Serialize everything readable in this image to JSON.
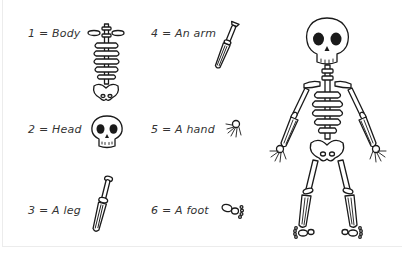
{
  "legend": [
    {
      "number": "1",
      "separator": "=",
      "name": "Body",
      "icon": "skeleton-body-icon"
    },
    {
      "number": "2",
      "separator": "=",
      "name": "Head",
      "icon": "skull-icon"
    },
    {
      "number": "3",
      "separator": "=",
      "name": "A leg",
      "icon": "leg-bone-icon"
    },
    {
      "number": "4",
      "separator": "=",
      "name": "An arm",
      "icon": "arm-bone-icon"
    },
    {
      "number": "5",
      "separator": "=",
      "name": "A hand",
      "icon": "hand-bones-icon"
    },
    {
      "number": "6",
      "separator": "=",
      "name": "A foot",
      "icon": "foot-bones-icon"
    }
  ],
  "labels": {
    "body": "1 = Body",
    "head": "2 = Head",
    "leg": "3 = A leg",
    "arm": "4 = An arm",
    "hand": "5 = A hand",
    "foot": "6 = A foot"
  },
  "figure": {
    "name": "full-skeleton",
    "line_color": "#1a1a1a",
    "fill_color": "#ffffff"
  }
}
